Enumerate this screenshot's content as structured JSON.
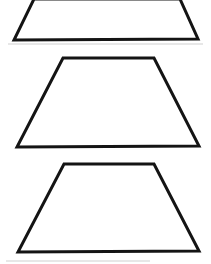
{
  "document": {
    "title": "Trapezoid Shapes",
    "background_color": "#ffffff",
    "width": 211,
    "height": 264
  },
  "style": {
    "stroke_color": "#141414",
    "stroke_width": 3,
    "fill": "none",
    "artifact_color": "#cfcfcf"
  },
  "shapes": [
    {
      "name": "trapezoid-top",
      "type": "trapezoid",
      "label": "Trapezoid 1 (cropped at top edge)",
      "clipped": true,
      "points": "34,-1 180,-1 198,39 14,40",
      "top_left": [
        34,
        -1
      ],
      "top_right": [
        180,
        -1
      ],
      "bottom_right": [
        198,
        39
      ],
      "bottom_left": [
        14,
        40
      ]
    },
    {
      "name": "trapezoid-middle",
      "type": "trapezoid",
      "label": "Trapezoid 2",
      "clipped": false,
      "points": "63,58 154,58 199,146 17,147",
      "top_left": [
        63,
        58
      ],
      "top_right": [
        154,
        58
      ],
      "bottom_right": [
        199,
        146
      ],
      "bottom_left": [
        17,
        147
      ]
    },
    {
      "name": "trapezoid-bottom",
      "type": "trapezoid",
      "label": "Trapezoid 3",
      "clipped": false,
      "points": "64,164 154,164 199,251 18,252",
      "top_left": [
        64,
        164
      ],
      "top_right": [
        154,
        164
      ],
      "bottom_right": [
        199,
        251
      ],
      "bottom_left": [
        18,
        252
      ]
    }
  ],
  "artifacts": [
    {
      "name": "scan-line-upper",
      "x1": 8,
      "y1": 44,
      "x2": 203,
      "y2": 44
    },
    {
      "name": "scan-line-lower",
      "x1": 6,
      "y1": 261,
      "x2": 150,
      "y2": 261
    }
  ]
}
